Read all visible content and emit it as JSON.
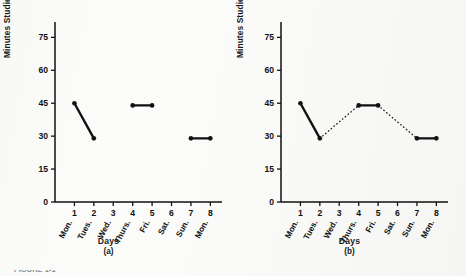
{
  "figure": {
    "background_color": "#fcfcfa",
    "ink_color": "#111111",
    "caption_partial": "FIGURE 1-1"
  },
  "chart_data": {
    "type": "line",
    "panels": [
      {
        "id": "a",
        "panel_label": "(a)",
        "title": "",
        "xlabel": "Days",
        "ylabel": "Minutes Studied",
        "xlim": [
          0,
          8.6
        ],
        "ylim": [
          0,
          82
        ],
        "yticks": [
          0,
          15,
          30,
          45,
          60,
          75
        ],
        "xticks": [
          1,
          2,
          3,
          4,
          5,
          6,
          7,
          8
        ],
        "xticklabels": [
          "Mon.",
          "Tues.",
          "Wed.",
          "Thurs.",
          "Fri.",
          "Sat.",
          "Sun.",
          "Mon."
        ],
        "grid": false,
        "legend": "none",
        "series": [
          {
            "name": "observed-segment-1",
            "style": "solid",
            "x": [
              1,
              2
            ],
            "values": [
              45,
              29
            ]
          },
          {
            "name": "observed-segment-2",
            "style": "solid",
            "x": [
              4,
              5
            ],
            "values": [
              44,
              44
            ]
          },
          {
            "name": "observed-segment-3",
            "style": "solid",
            "x": [
              7,
              8
            ],
            "values": [
              29,
              29
            ]
          }
        ]
      },
      {
        "id": "b",
        "panel_label": "(b)",
        "title": "",
        "xlabel": "Days",
        "ylabel": "Minutes Studied",
        "xlim": [
          0,
          8.6
        ],
        "ylim": [
          0,
          82
        ],
        "yticks": [
          0,
          15,
          30,
          45,
          60,
          75
        ],
        "xticks": [
          1,
          2,
          3,
          4,
          5,
          6,
          7,
          8
        ],
        "xticklabels": [
          "Mon.",
          "Tues.",
          "Wed.",
          "Thurs.",
          "Fri.",
          "Sat.",
          "Sun.",
          "Mon."
        ],
        "grid": false,
        "legend": "none",
        "series": [
          {
            "name": "observed-segment-1",
            "style": "solid",
            "x": [
              1,
              2
            ],
            "values": [
              45,
              29
            ]
          },
          {
            "name": "observed-segment-2",
            "style": "solid",
            "x": [
              4,
              5
            ],
            "values": [
              44,
              44
            ]
          },
          {
            "name": "observed-segment-3",
            "style": "solid",
            "x": [
              7,
              8
            ],
            "values": [
              29,
              29
            ]
          },
          {
            "name": "interpolated-connector-1",
            "style": "dotted",
            "x": [
              2,
              4
            ],
            "values": [
              29,
              44
            ]
          },
          {
            "name": "interpolated-connector-2",
            "style": "dotted",
            "x": [
              5,
              7
            ],
            "values": [
              44,
              29
            ]
          }
        ]
      }
    ]
  }
}
